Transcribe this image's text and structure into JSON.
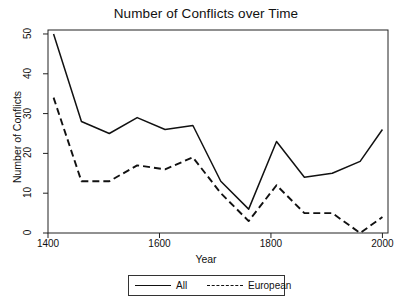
{
  "chart_data": {
    "type": "line",
    "title": "Number of Conflicts over Time",
    "xlabel": "Year",
    "ylabel": "Number of Conflicts",
    "xlim": [
      1400,
      2010
    ],
    "ylim": [
      0,
      51
    ],
    "xticks": [
      1400,
      1600,
      1800,
      2000
    ],
    "yticks": [
      0,
      10,
      20,
      30,
      40,
      50
    ],
    "grid": false,
    "legend_position": "below-plot",
    "x": [
      1410,
      1460,
      1510,
      1560,
      1610,
      1660,
      1710,
      1760,
      1810,
      1860,
      1910,
      1960,
      2000
    ],
    "series": [
      {
        "name": "All",
        "style": "solid",
        "color": "#111111",
        "values": [
          50,
          28,
          25,
          29,
          26,
          27,
          13,
          6,
          23,
          14,
          15,
          18,
          26
        ]
      },
      {
        "name": "European",
        "style": "dashed",
        "color": "#111111",
        "values": [
          34,
          13,
          13,
          17,
          16,
          19,
          10,
          3,
          12,
          5,
          5,
          0,
          4
        ]
      }
    ]
  },
  "axis": {
    "x_tick_labels": [
      "1400",
      "1600",
      "1800",
      "2000"
    ],
    "y_tick_labels": [
      "0",
      "10",
      "20",
      "30",
      "40",
      "50"
    ]
  },
  "legend": {
    "items": [
      {
        "label": "All",
        "style": "solid"
      },
      {
        "label": "European",
        "style": "dashed"
      }
    ]
  }
}
